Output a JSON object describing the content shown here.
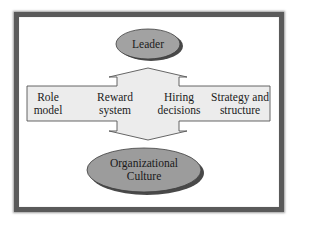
{
  "diagram": {
    "top_node": {
      "label": "Leader"
    },
    "bottom_node": {
      "line1": "Organizational",
      "line2": "Culture"
    },
    "mechanisms": [
      {
        "line1": "Role",
        "line2": "model"
      },
      {
        "line1": "Reward",
        "line2": "system"
      },
      {
        "line1": "Hiring",
        "line2": "decisions"
      },
      {
        "line1": "Strategy and",
        "line2": "structure"
      }
    ]
  },
  "colors": {
    "frame_border": "#5a5a5a",
    "ellipse_fill": "#9c9c9c",
    "ellipse_shadow": "#4a4a4a",
    "arrow_fill": "#ececec",
    "arrow_stroke": "#555555",
    "text": "#1a1a1a"
  }
}
